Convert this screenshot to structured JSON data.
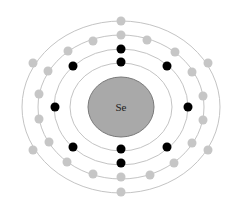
{
  "diagram": {
    "element_symbol": "Se",
    "shell_configuration": [
      2,
      8,
      18,
      6
    ],
    "center": [
      121,
      107
    ],
    "colors": {
      "background": "#ffffff",
      "nucleus_fill": "#a9a9a9",
      "nucleus_stroke": "#7a7a7a",
      "shell_line": "#c4c4c4",
      "inner_electron": "#000000",
      "outer_electron": "#c6c6c6"
    },
    "nucleus": {
      "rx": 33,
      "ry": 30
    },
    "shells": [
      {
        "rx": 51,
        "ry": 44
      },
      {
        "rx": 67,
        "ry": 58
      },
      {
        "rx": 83,
        "ry": 72
      },
      {
        "rx": 99,
        "ry": 86
      }
    ],
    "electrons": [
      {
        "shell": 1,
        "type": "inner",
        "x": 121,
        "y": 62
      },
      {
        "shell": 1,
        "type": "inner",
        "x": 121,
        "y": 149
      },
      {
        "shell": 2,
        "type": "inner",
        "x": 121,
        "y": 49
      },
      {
        "shell": 2,
        "type": "inner",
        "x": 121,
        "y": 163
      },
      {
        "shell": 2,
        "type": "inner",
        "x": 55,
        "y": 107
      },
      {
        "shell": 2,
        "type": "inner",
        "x": 188,
        "y": 107
      },
      {
        "shell": 2,
        "type": "inner",
        "x": 73,
        "y": 66
      },
      {
        "shell": 2,
        "type": "inner",
        "x": 167,
        "y": 66
      },
      {
        "shell": 2,
        "type": "inner",
        "x": 73,
        "y": 147
      },
      {
        "shell": 2,
        "type": "inner",
        "x": 167,
        "y": 147
      },
      {
        "shell": 3,
        "type": "outer",
        "x": 121,
        "y": 35
      },
      {
        "shell": 3,
        "type": "outer",
        "x": 121,
        "y": 177
      },
      {
        "shell": 3,
        "type": "outer",
        "x": 93,
        "y": 41
      },
      {
        "shell": 3,
        "type": "outer",
        "x": 147,
        "y": 40
      },
      {
        "shell": 3,
        "type": "outer",
        "x": 68,
        "y": 51
      },
      {
        "shell": 3,
        "type": "outer",
        "x": 175,
        "y": 52
      },
      {
        "shell": 3,
        "type": "outer",
        "x": 48,
        "y": 71
      },
      {
        "shell": 3,
        "type": "outer",
        "x": 192,
        "y": 72
      },
      {
        "shell": 3,
        "type": "outer",
        "x": 39,
        "y": 94
      },
      {
        "shell": 3,
        "type": "outer",
        "x": 203,
        "y": 96
      },
      {
        "shell": 3,
        "type": "outer",
        "x": 39,
        "y": 119
      },
      {
        "shell": 3,
        "type": "outer",
        "x": 203,
        "y": 120
      },
      {
        "shell": 3,
        "type": "outer",
        "x": 49,
        "y": 142
      },
      {
        "shell": 3,
        "type": "outer",
        "x": 192,
        "y": 143
      },
      {
        "shell": 3,
        "type": "outer",
        "x": 67,
        "y": 162
      },
      {
        "shell": 3,
        "type": "outer",
        "x": 174,
        "y": 163
      },
      {
        "shell": 3,
        "type": "outer",
        "x": 93,
        "y": 174
      },
      {
        "shell": 3,
        "type": "outer",
        "x": 150,
        "y": 175
      },
      {
        "shell": 4,
        "type": "outer",
        "x": 121,
        "y": 21
      },
      {
        "shell": 4,
        "type": "outer",
        "x": 121,
        "y": 192
      },
      {
        "shell": 4,
        "type": "outer",
        "x": 33,
        "y": 63
      },
      {
        "shell": 4,
        "type": "outer",
        "x": 208,
        "y": 63
      },
      {
        "shell": 4,
        "type": "outer",
        "x": 33,
        "y": 150
      },
      {
        "shell": 4,
        "type": "outer",
        "x": 208,
        "y": 150
      }
    ],
    "electron_radius": 4.5
  }
}
